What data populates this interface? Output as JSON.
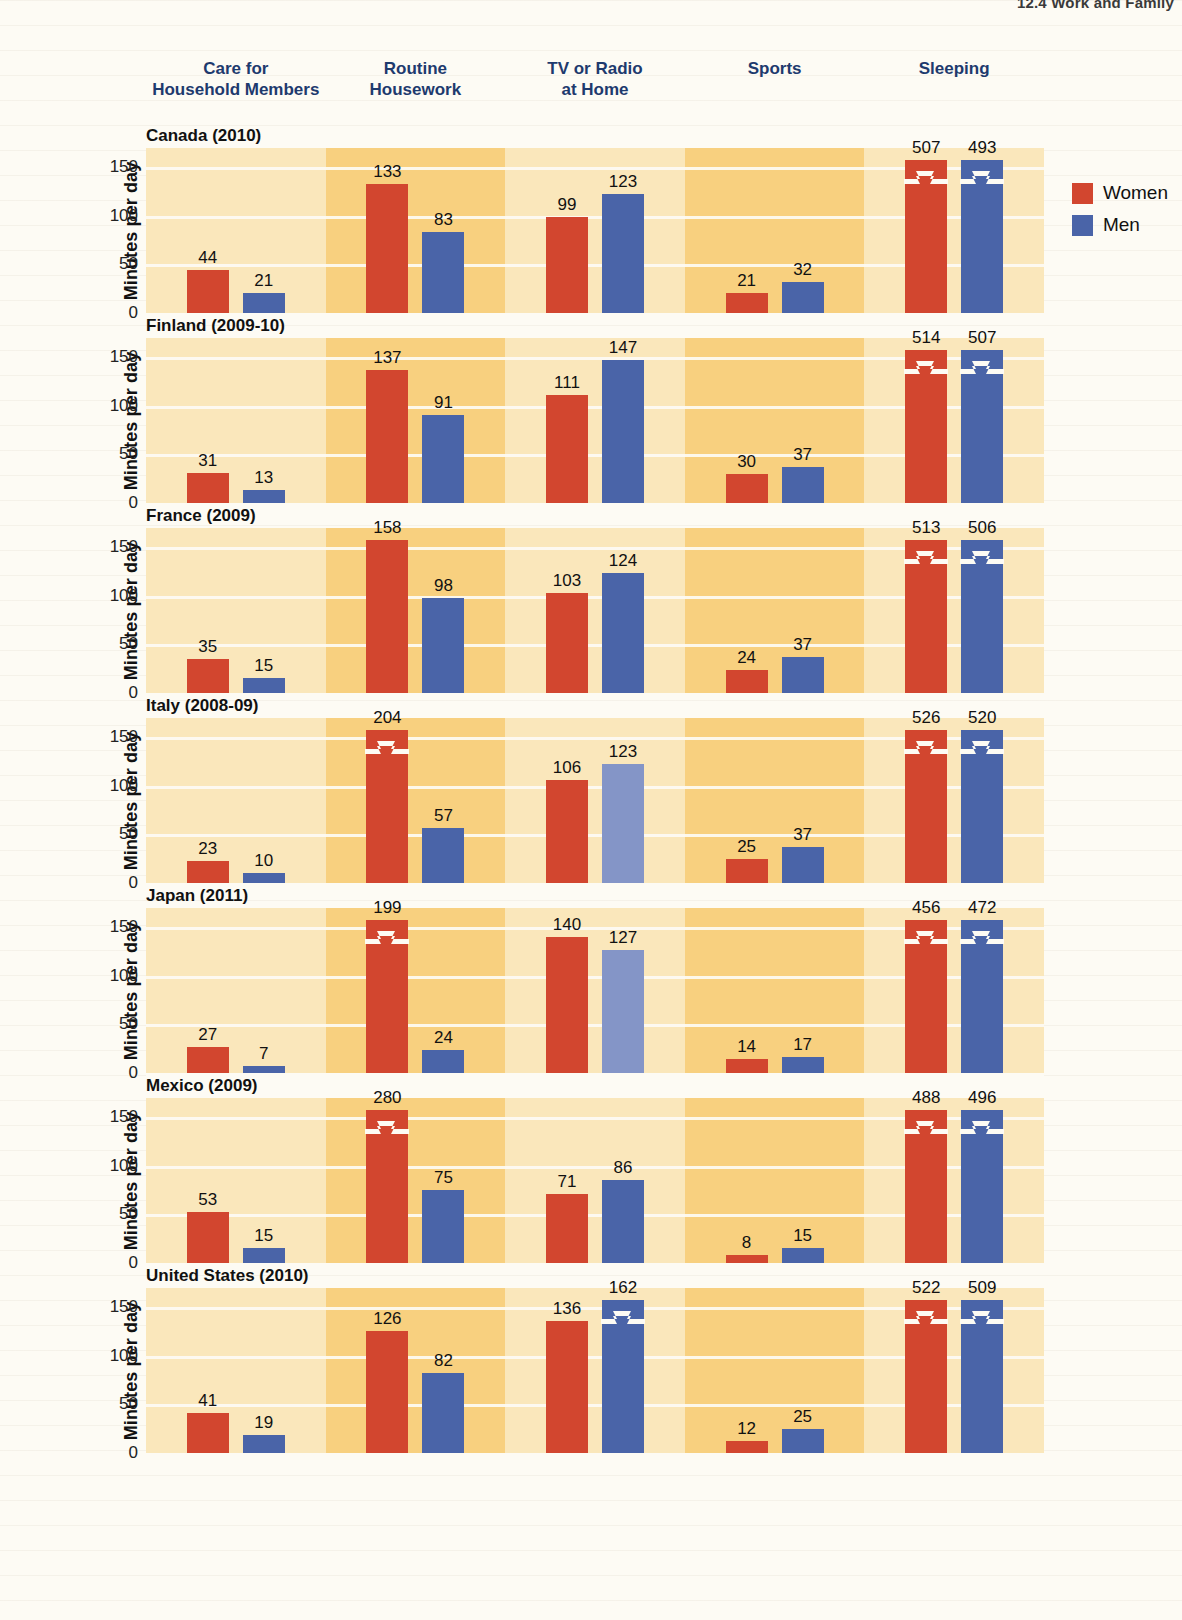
{
  "page": {
    "running_head": "12.4  Work and Family"
  },
  "legend": {
    "position": "right",
    "items": [
      {
        "label": "Women",
        "color": "#d2462f"
      },
      {
        "label": "Men",
        "color": "#4a64a8"
      }
    ]
  },
  "axis": {
    "ylabel": "Minutes per day",
    "yticks": [
      0,
      50,
      100,
      150
    ],
    "ylim": [
      0,
      170
    ]
  },
  "colors": {
    "women": "#d2462f",
    "men": "#4a64a8",
    "men_light": "#8495c7",
    "band_light": "#fae7bb",
    "band_dark": "#f8d07f",
    "paper": "#fdfbf4",
    "gridline": "#fdfbf4",
    "header_text": "#1e3a6e"
  },
  "chart_data": {
    "type": "bar",
    "title": "",
    "xlabel": "",
    "ylabel": "Minutes per day",
    "ylim": [
      0,
      170
    ],
    "yticks": [
      0,
      50,
      100,
      150
    ],
    "grid": true,
    "legend": [
      "Women",
      "Men"
    ],
    "note": "Small-multiples panel chart: rows = countries, columns = activity categories. Bars exceeding the 150-minute axis cap are drawn truncated with a zigzag break mark.",
    "categories": [
      "Care for Household Members",
      "Routine Housework",
      "TV or Radio at Home",
      "Sports",
      "Sleeping"
    ],
    "panels": [
      {
        "country": "Canada (2010)",
        "values": {
          "Care for Household Members": {
            "Women": 44,
            "Men": 21
          },
          "Routine Housework": {
            "Women": 133,
            "Men": 83
          },
          "TV or Radio at Home": {
            "Women": 99,
            "Men": 123
          },
          "Sports": {
            "Women": 21,
            "Men": 32
          },
          "Sleeping": {
            "Women": 507,
            "Men": 493
          }
        }
      },
      {
        "country": "Finland (2009-10)",
        "values": {
          "Care for Household Members": {
            "Women": 31,
            "Men": 13
          },
          "Routine Housework": {
            "Women": 137,
            "Men": 91
          },
          "TV or Radio at Home": {
            "Women": 111,
            "Men": 147
          },
          "Sports": {
            "Women": 30,
            "Men": 37
          },
          "Sleeping": {
            "Women": 514,
            "Men": 507
          }
        }
      },
      {
        "country": "France (2009)",
        "values": {
          "Care for Household Members": {
            "Women": 35,
            "Men": 15
          },
          "Routine Housework": {
            "Women": 158,
            "Men": 98
          },
          "TV or Radio at Home": {
            "Women": 103,
            "Men": 124
          },
          "Sports": {
            "Women": 24,
            "Men": 37
          },
          "Sleeping": {
            "Women": 513,
            "Men": 506
          }
        }
      },
      {
        "country": "Italy (2008-09)",
        "values": {
          "Care for Household Members": {
            "Women": 23,
            "Men": 10
          },
          "Routine Housework": {
            "Women": 204,
            "Men": 57
          },
          "TV or Radio at Home": {
            "Women": 106,
            "Men": 123
          },
          "Sports": {
            "Women": 25,
            "Men": 37
          },
          "Sleeping": {
            "Women": 526,
            "Men": 520
          }
        }
      },
      {
        "country": "Japan (2011)",
        "values": {
          "Care for Household Members": {
            "Women": 27,
            "Men": 7
          },
          "Routine Housework": {
            "Women": 199,
            "Men": 24
          },
          "TV or Radio at Home": {
            "Women": 140,
            "Men": 127
          },
          "Sports": {
            "Women": 14,
            "Men": 17
          },
          "Sleeping": {
            "Women": 456,
            "Men": 472
          }
        }
      },
      {
        "country": "Mexico (2009)",
        "values": {
          "Care for Household Members": {
            "Women": 53,
            "Men": 15
          },
          "Routine Housework": {
            "Women": 280,
            "Men": 75
          },
          "TV or Radio at Home": {
            "Women": 71,
            "Men": 86
          },
          "Sports": {
            "Women": 8,
            "Men": 15
          },
          "Sleeping": {
            "Women": 488,
            "Men": 496
          }
        }
      },
      {
        "country": "United States (2010)",
        "values": {
          "Care for Household Members": {
            "Women": 41,
            "Men": 19
          },
          "Routine Housework": {
            "Women": 126,
            "Men": 82
          },
          "TV or Radio at Home": {
            "Women": 136,
            "Men": 162
          },
          "Sports": {
            "Women": 12,
            "Men": 25
          },
          "Sleeping": {
            "Women": 522,
            "Men": 509
          }
        }
      }
    ]
  }
}
